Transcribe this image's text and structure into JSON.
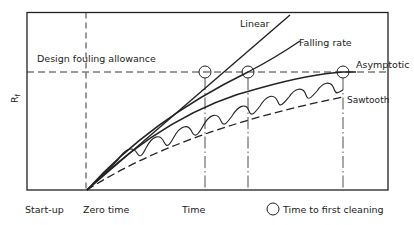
{
  "diagram": {
    "type": "fouling-curves",
    "y_axis_label": "R",
    "y_axis_subscript": "f",
    "design_line_label": "Design fouling allowance",
    "curves": [
      {
        "id": "linear",
        "label": "Linear"
      },
      {
        "id": "falling-rate",
        "label": "Falling rate"
      },
      {
        "id": "asymptotic",
        "label": "Asymptotic"
      },
      {
        "id": "sawtooth",
        "label": "Sawtooth"
      }
    ],
    "x_labels": {
      "startup": "Start-up",
      "zero_time": "Zero time",
      "time": "Time"
    },
    "legend": {
      "symbol": "circle",
      "label": "Time to first cleaning"
    },
    "colors": {
      "ink": "#222222",
      "background": "#ffffff"
    }
  }
}
